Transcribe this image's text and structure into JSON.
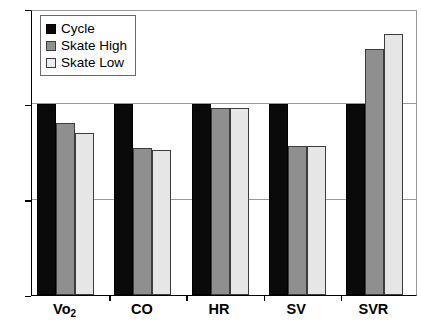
{
  "chart_data": {
    "type": "bar",
    "title": "",
    "xlabel": "",
    "ylabel": "",
    "ylim": [
      0,
      150
    ],
    "yticks": [
      0,
      50,
      100,
      150
    ],
    "ytick_labels": [
      "0",
      "50",
      "100",
      "150"
    ],
    "grid": true,
    "legend_position": "top-left",
    "categories": [
      "Vo2",
      "CO",
      "HR",
      "SV",
      "SVR"
    ],
    "category_labels": [
      {
        "text": "Vo",
        "sub": "2"
      },
      {
        "text": "CO",
        "sub": ""
      },
      {
        "text": "HR",
        "sub": ""
      },
      {
        "text": "SV",
        "sub": ""
      },
      {
        "text": "SVR",
        "sub": ""
      }
    ],
    "series": [
      {
        "name": "Cycle",
        "color": "#0a0a0a",
        "values": [
          100,
          100,
          100,
          100,
          100
        ]
      },
      {
        "name": "Skate High",
        "color": "#8f8f8f",
        "values": [
          90,
          77,
          98,
          78,
          129
        ]
      },
      {
        "name": "Skate Low",
        "color": "#e6e6e6",
        "values": [
          85,
          76,
          98,
          78,
          137
        ]
      }
    ]
  },
  "legend": {
    "items": [
      {
        "label": "Cycle",
        "swatch": "cycle"
      },
      {
        "label": "Skate High",
        "swatch": "skatehigh"
      },
      {
        "label": "Skate Low",
        "swatch": "skatelow"
      }
    ]
  }
}
